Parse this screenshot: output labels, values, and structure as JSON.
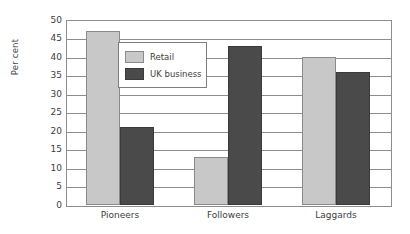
{
  "chart_data": {
    "type": "bar",
    "title": "",
    "subtitle": "",
    "xlabel": "",
    "ylabel": "Per cent",
    "categories": [
      "Pioneers",
      "Followers",
      "Laggards"
    ],
    "series": [
      {
        "name": "Retail",
        "values": [
          47,
          13,
          40
        ],
        "color": "#c8c8c8"
      },
      {
        "name": "UK business",
        "values": [
          21,
          43,
          36
        ],
        "color": "#4a4a4a"
      }
    ],
    "ylim": [
      0,
      50
    ],
    "ytick_step": 5,
    "ytick_labels": [
      "50",
      "45",
      "40",
      "35",
      "30",
      "25",
      "20",
      "15",
      "10",
      "5",
      "0"
    ],
    "grid": "horizontal",
    "legend_position": "inside-upper-left",
    "orientation": "vertical",
    "grouped": true
  },
  "axes": {
    "y_title": "Per cent"
  },
  "legend": {
    "entries": [
      {
        "label": "Retail",
        "color": "#c8c8c8"
      },
      {
        "label": "UK business",
        "color": "#4a4a4a"
      }
    ]
  },
  "colors": {
    "retail": "#c8c8c8",
    "uk_business": "#4a4a4a",
    "axis": "#8d8d8d",
    "text": "#3d3d3d",
    "background": "#ffffff"
  }
}
